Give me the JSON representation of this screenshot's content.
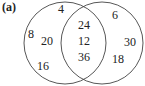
{
  "figure": {
    "label": "(a)",
    "circles": [
      {
        "name": "left",
        "cx": 65,
        "cy": 43,
        "r": 41
      },
      {
        "name": "right",
        "cx": 102,
        "cy": 43,
        "r": 41
      }
    ],
    "regions": {
      "left_only": [
        {
          "value": "4",
          "x": 61,
          "y": 13
        },
        {
          "value": "8",
          "x": 31,
          "y": 38
        },
        {
          "value": "20",
          "x": 47,
          "y": 45
        },
        {
          "value": "16",
          "x": 43,
          "y": 70
        }
      ],
      "intersection": [
        {
          "value": "24",
          "x": 84,
          "y": 29
        },
        {
          "value": "12",
          "x": 84,
          "y": 45
        },
        {
          "value": "36",
          "x": 84,
          "y": 61
        }
      ],
      "right_only": [
        {
          "value": "6",
          "x": 115,
          "y": 19
        },
        {
          "value": "30",
          "x": 130,
          "y": 46
        },
        {
          "value": "18",
          "x": 118,
          "y": 63
        }
      ]
    }
  }
}
